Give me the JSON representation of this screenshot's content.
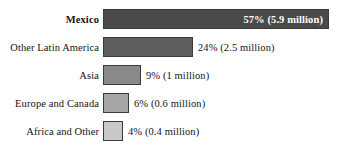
{
  "chart_data": {
    "type": "bar",
    "orientation": "horizontal",
    "title": "",
    "xlabel": "",
    "ylabel": "",
    "grid": false,
    "legend": null,
    "axis_visible": false,
    "xlim": [
      0,
      57
    ],
    "categories": [
      "Mexico",
      "Other Latin America",
      "Asia",
      "Europe and Canada",
      "Africa and Other"
    ],
    "values": [
      57,
      24,
      9,
      6,
      4
    ],
    "value_unit": "percent",
    "counts_millions": [
      5.9,
      2.5,
      1,
      0.6,
      0.4
    ],
    "data_labels": [
      "57% (5.9 million)",
      "24% (2.5 million)",
      "9% (1 million)",
      "6% (0.6 million)",
      "4% (0.4 million)"
    ],
    "bar_colors": [
      "#4a4a4a",
      "#5e5e5e",
      "#8a8a8a",
      "#a5a5a5",
      "#c8c8c8"
    ],
    "bar_border_color": "#3a3a3a",
    "background_color": "#ffffff",
    "text_color": "#141414",
    "inside_label_color": "#ffffff"
  },
  "rows": [
    {
      "label": "Mexico",
      "value_label": "57% (5.9 million)",
      "bar_width_px": 226,
      "color": "#4a4a4a",
      "bold_label": true,
      "label_inside": true
    },
    {
      "label": "Other Latin America",
      "value_label": "24% (2.5 million)",
      "bar_width_px": 90,
      "color": "#5e5e5e",
      "bold_label": false,
      "label_inside": false
    },
    {
      "label": "Asia",
      "value_label": "9% (1 million)",
      "bar_width_px": 38,
      "color": "#8a8a8a",
      "bold_label": false,
      "label_inside": false
    },
    {
      "label": "Europe and Canada",
      "value_label": "6% (0.6 million)",
      "bar_width_px": 26,
      "color": "#a5a5a5",
      "bold_label": false,
      "label_inside": false
    },
    {
      "label": "Africa and Other",
      "value_label": "4% (0.4 million)",
      "bar_width_px": 20,
      "color": "#c8c8c8",
      "bold_label": false,
      "label_inside": false
    }
  ]
}
